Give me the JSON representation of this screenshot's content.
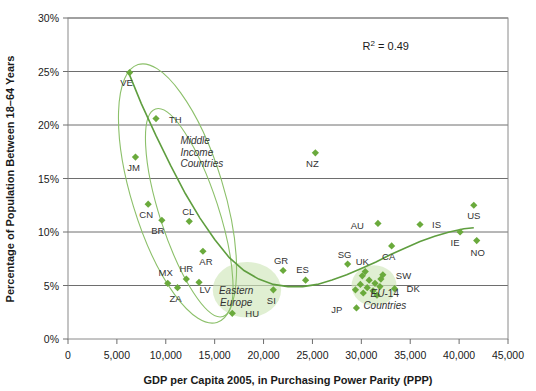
{
  "chart_data": {
    "type": "scatter",
    "title": "",
    "xlabel": "GDP per Capita 2005, in Purchasing Power Parity (PPP)",
    "ylabel": "Percentage of Population Between 18–64 Years",
    "xlim": [
      0,
      45000
    ],
    "ylim": [
      0,
      30
    ],
    "xticks": [
      0,
      5000,
      10000,
      15000,
      20000,
      25000,
      30000,
      35000,
      40000,
      45000
    ],
    "xtick_labels": [
      "0",
      "5,000",
      "10,000",
      "15,000",
      "20,000",
      "25,000",
      "30,000",
      "35,000",
      "40,000",
      "45,000"
    ],
    "yticks": [
      0,
      5,
      10,
      15,
      20,
      25,
      30
    ],
    "ytick_labels": [
      "0%",
      "5%",
      "10%",
      "15%",
      "20%",
      "25%",
      "30%"
    ],
    "grid": "horizontal",
    "legend": "none",
    "annotations": [
      {
        "name": "r2",
        "text": "R² = 0.49",
        "x": 32500,
        "y": 27.0
      },
      {
        "name": "middle-income-countries",
        "text": "Middle Income Countries",
        "lines": [
          "Middle",
          "Income",
          "Countries"
        ],
        "x": 11500,
        "y": 18.2,
        "style": "italic"
      },
      {
        "name": "eastern-europe",
        "text": "Eastern Europe",
        "lines": [
          "Eastern",
          "Europe"
        ],
        "x": 17200,
        "y": 4.2,
        "style": "italic"
      },
      {
        "name": "eu-14-countries",
        "text": "EU-14 Countries",
        "lines": [
          "EU-14",
          "Countries"
        ],
        "x": 32400,
        "y": 3.9,
        "style": "italic"
      }
    ],
    "trend_curve": {
      "name": "polynomial-trendline",
      "color": "#5f9e3f",
      "points": [
        [
          6200,
          24.9
        ],
        [
          7500,
          22.0
        ],
        [
          9000,
          19.0
        ],
        [
          10500,
          16.2
        ],
        [
          12000,
          13.6
        ],
        [
          13500,
          11.3
        ],
        [
          15000,
          9.3
        ],
        [
          16500,
          7.6
        ],
        [
          18000,
          6.4
        ],
        [
          19500,
          5.6
        ],
        [
          21000,
          5.1
        ],
        [
          22500,
          4.9
        ],
        [
          24000,
          4.9
        ],
        [
          25500,
          5.1
        ],
        [
          27000,
          5.5
        ],
        [
          28500,
          6.0
        ],
        [
          30000,
          6.6
        ],
        [
          31500,
          7.2
        ],
        [
          33000,
          7.9
        ],
        [
          34500,
          8.5
        ],
        [
          36000,
          9.1
        ],
        [
          37500,
          9.6
        ],
        [
          39000,
          10.0
        ],
        [
          40500,
          10.3
        ],
        [
          41500,
          10.4
        ]
      ]
    },
    "ellipses": [
      {
        "name": "middle-income-outer-ellipse",
        "cx": 11200,
        "cy": 13.6,
        "rx": 4700,
        "ry": 12.6,
        "rotation": -17,
        "style": "outline"
      },
      {
        "name": "middle-income-inner-ellipse",
        "cx": 12400,
        "cy": 11.8,
        "rx": 3000,
        "ry": 10.2,
        "rotation": -18,
        "style": "outline"
      },
      {
        "name": "eastern-europe-blob",
        "cx": 18300,
        "cy": 4.6,
        "rx": 3500,
        "ry": 2.6,
        "rotation": 0,
        "style": "filled"
      },
      {
        "name": "eu-14-blob",
        "cx": 31300,
        "cy": 5.0,
        "rx": 2300,
        "ry": 1.9,
        "rotation": 0,
        "style": "filled"
      }
    ],
    "marker_color": "#6aaa3c",
    "points": [
      {
        "label": "VE",
        "x": 6300,
        "y": 24.9,
        "lx": -3,
        "ly": 13
      },
      {
        "label": "TH",
        "x": 9000,
        "y": 20.6,
        "lx": 13,
        "ly": 4
      },
      {
        "label": "JM",
        "x": 6900,
        "y": 17.0,
        "lx": -2,
        "ly": 14
      },
      {
        "label": "NZ",
        "x": 25300,
        "y": 17.4,
        "lx": -3,
        "ly": 14
      },
      {
        "label": "CN",
        "x": 8200,
        "y": 12.6,
        "lx": -2,
        "ly": 14
      },
      {
        "label": "BR",
        "x": 9600,
        "y": 11.1,
        "lx": -4,
        "ly": 14
      },
      {
        "label": "CL",
        "x": 12400,
        "y": 11.0,
        "lx": -1,
        "ly": -6
      },
      {
        "label": "US",
        "x": 41500,
        "y": 12.5,
        "lx": 0,
        "ly": 14
      },
      {
        "label": "IS",
        "x": 36000,
        "y": 10.7,
        "lx": 12,
        "ly": 3
      },
      {
        "label": "AU",
        "x": 31700,
        "y": 10.8,
        "lx": -14,
        "ly": 6
      },
      {
        "label": "AR",
        "x": 13800,
        "y": 8.2,
        "lx": 3,
        "ly": 14
      },
      {
        "label": "CA",
        "x": 33100,
        "y": 8.7,
        "lx": -3,
        "ly": 14
      },
      {
        "label": "IE",
        "x": 40100,
        "y": 10.0,
        "lx": -5,
        "ly": 14
      },
      {
        "label": "NO",
        "x": 41800,
        "y": 9.2,
        "lx": 1,
        "ly": 15
      },
      {
        "label": "SG",
        "x": 28600,
        "y": 7.0,
        "lx": -3,
        "ly": -6
      },
      {
        "label": "GR",
        "x": 22000,
        "y": 6.4,
        "lx": -2,
        "ly": -7
      },
      {
        "label": "UK",
        "x": 30400,
        "y": 6.3,
        "lx": -3,
        "ly": -7
      },
      {
        "label": "SW",
        "x": 32200,
        "y": 6.0,
        "lx": 13,
        "ly": 4
      },
      {
        "label": "ES",
        "x": 24300,
        "y": 5.5,
        "lx": -3,
        "ly": -7
      },
      {
        "label": "MX",
        "x": 10200,
        "y": 5.2,
        "lx": -2,
        "ly": -7
      },
      {
        "label": "HR",
        "x": 12100,
        "y": 5.6,
        "lx": 0,
        "ly": -7
      },
      {
        "label": "LV",
        "x": 13400,
        "y": 5.3,
        "lx": 6,
        "ly": 11
      },
      {
        "label": "ZA",
        "x": 11200,
        "y": 4.8,
        "lx": -2,
        "ly": 14
      },
      {
        "label": "SI",
        "x": 21000,
        "y": 4.6,
        "lx": -2,
        "ly": 14
      },
      {
        "label": "DK",
        "x": 33400,
        "y": 4.7,
        "lx": 12,
        "ly": 3
      },
      {
        "label": "JP",
        "x": 29500,
        "y": 2.9,
        "lx": -14,
        "ly": 5
      },
      {
        "label": "HU",
        "x": 16800,
        "y": 2.4,
        "lx": 13,
        "ly": 4
      },
      {
        "label": "",
        "x": 30100,
        "y": 5.9,
        "lx": 0,
        "ly": 0
      },
      {
        "label": "",
        "x": 30800,
        "y": 5.5,
        "lx": 0,
        "ly": 0
      },
      {
        "label": "",
        "x": 29900,
        "y": 5.1,
        "lx": 0,
        "ly": 0
      },
      {
        "label": "",
        "x": 30600,
        "y": 4.8,
        "lx": 0,
        "ly": 0
      },
      {
        "label": "",
        "x": 31400,
        "y": 5.2,
        "lx": 0,
        "ly": 0
      },
      {
        "label": "",
        "x": 31200,
        "y": 4.5,
        "lx": 0,
        "ly": 0
      },
      {
        "label": "",
        "x": 30200,
        "y": 4.3,
        "lx": 0,
        "ly": 0
      },
      {
        "label": "",
        "x": 31900,
        "y": 4.9,
        "lx": 0,
        "ly": 0
      },
      {
        "label": "",
        "x": 29400,
        "y": 4.6,
        "lx": 0,
        "ly": 0
      },
      {
        "label": "",
        "x": 32000,
        "y": 5.6,
        "lx": 0,
        "ly": 0
      },
      {
        "label": "",
        "x": 31600,
        "y": 4.1,
        "lx": 0,
        "ly": 0
      }
    ]
  },
  "axes": {
    "x_title": "GDP per Capita 2005, in Purchasing Power Parity (PPP)",
    "y_title": "Percentage of Population Between 18–64 Years"
  },
  "r2": {
    "text": "R² = 0.49"
  }
}
